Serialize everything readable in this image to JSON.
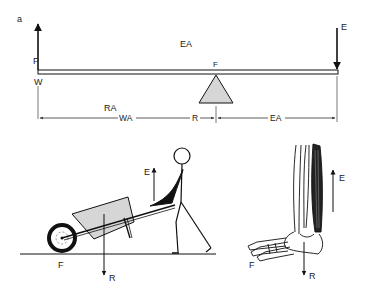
{
  "figure": {
    "panel_label": "a",
    "colors": {
      "ink": "#111111",
      "fill": "#d6d6d6",
      "background": "#ffffff",
      "thin": "#555555"
    }
  },
  "lever": {
    "effort_arm_label_top": "EA",
    "fulcrum_label": "F",
    "left_force_label": "F",
    "left_weight_label": "W",
    "effort_label": "E",
    "resistance_arm_label": "RA",
    "weight_arm_label": "WA",
    "resistance_label": "R",
    "effort_arm_label_bottom": "EA"
  },
  "wheelbarrow": {
    "fulcrum_label": "F",
    "effort_label": "E",
    "resistance_label": "R"
  },
  "foot": {
    "fulcrum_label": "F",
    "effort_label": "E",
    "resistance_label": "R"
  }
}
